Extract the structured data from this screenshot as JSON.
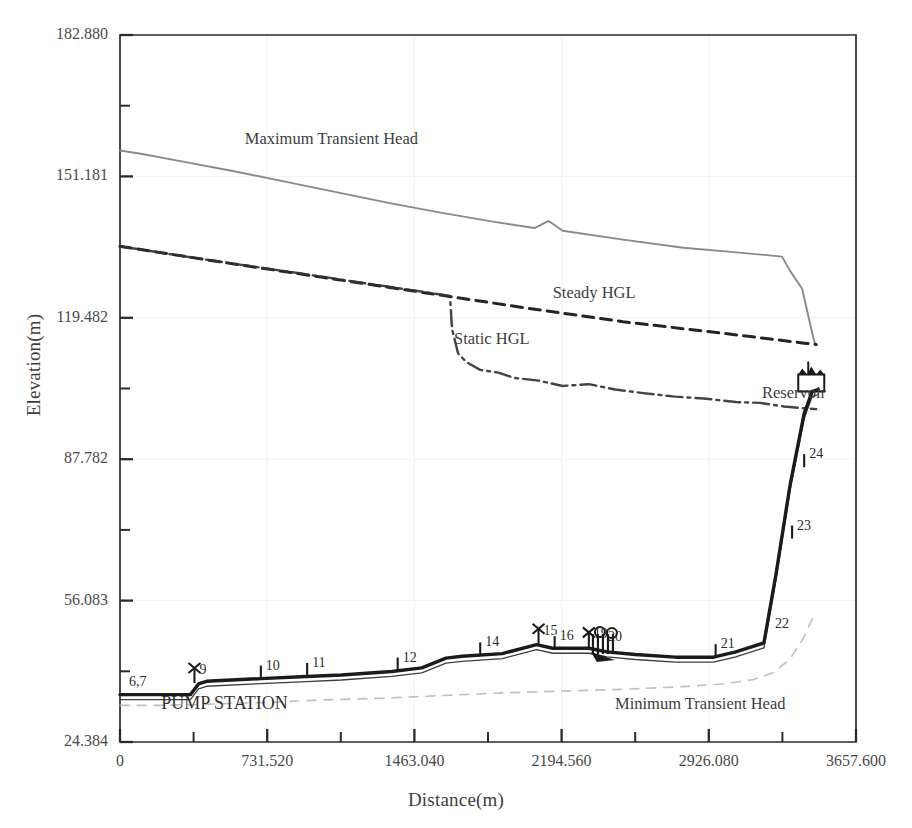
{
  "chart_data": {
    "type": "line",
    "title": "",
    "xlabel": "Distance(m)",
    "ylabel": "Elevation(m)",
    "xlim": [
      0,
      3657.6
    ],
    "ylim": [
      24.384,
      182.88
    ],
    "xticks": [
      "0",
      "731.520",
      "1463.040",
      "2194.560",
      "2926.080",
      "3657.600"
    ],
    "xtick_values": [
      0,
      731.52,
      1463.04,
      2194.56,
      2926.08,
      3657.6
    ],
    "yticks": [
      "182.880",
      "151.181",
      "119.482",
      "87.782",
      "56.083",
      "24.384"
    ],
    "ytick_values": [
      182.88,
      151.181,
      119.482,
      87.782,
      56.083,
      24.384
    ],
    "minor_ticks": true,
    "grid": "faint",
    "legend": "none (inline annotations)",
    "annotations": [
      {
        "name": "max-transient-head",
        "text": "Maximum Transient Head",
        "x": 620,
        "y": 158.5
      },
      {
        "name": "steady-hgl",
        "text": "Steady HGL",
        "x": 2150,
        "y": 124.0
      },
      {
        "name": "static-hgl",
        "text": "Static HGL",
        "x": 1660,
        "y": 113.5
      },
      {
        "name": "reservoir",
        "text": "Reservoir",
        "x": 3190,
        "y": 101.5
      },
      {
        "name": "minimum-transient-head",
        "text": "Minimum Transient Head",
        "x": 2460,
        "y": 31.8
      },
      {
        "name": "pump-station",
        "text": "PUMP STATION",
        "x": 205,
        "y": 31.8
      }
    ],
    "series": [
      {
        "name": "Maximum Transient Head",
        "style": "solid",
        "color": "#8a8a8a",
        "points": [
          [
            0,
            157.0
          ],
          [
            110,
            156.2
          ],
          [
            300,
            154.6
          ],
          [
            560,
            152.4
          ],
          [
            820,
            150.0
          ],
          [
            1080,
            147.6
          ],
          [
            1340,
            145.2
          ],
          [
            1600,
            143.0
          ],
          [
            1860,
            141.0
          ],
          [
            2060,
            139.6
          ],
          [
            2130,
            141.2
          ],
          [
            2200,
            139.0
          ],
          [
            2500,
            137.0
          ],
          [
            2800,
            135.2
          ],
          [
            3050,
            134.2
          ],
          [
            3200,
            133.6
          ],
          [
            3290,
            133.2
          ],
          [
            3330,
            130.0
          ],
          [
            3390,
            126.0
          ],
          [
            3420,
            120.0
          ],
          [
            3440,
            116.0
          ],
          [
            3455,
            113.5
          ]
        ]
      },
      {
        "name": "Steady HGL",
        "style": "dashed",
        "color": "#242424",
        "points": [
          [
            0,
            135.5
          ],
          [
            500,
            132.0
          ],
          [
            1000,
            128.6
          ],
          [
            1500,
            125.2
          ],
          [
            2000,
            121.8
          ],
          [
            2500,
            118.6
          ],
          [
            3000,
            116.0
          ],
          [
            3400,
            113.8
          ],
          [
            3460,
            113.5
          ]
        ]
      },
      {
        "name": "Static HGL",
        "style": "dashdot",
        "color": "#333333",
        "points": [
          [
            0,
            135.5
          ],
          [
            400,
            132.7
          ],
          [
            900,
            129.4
          ],
          [
            1400,
            126.0
          ],
          [
            1640,
            124.4
          ],
          [
            1650,
            117.0
          ],
          [
            1680,
            111.5
          ],
          [
            1720,
            109.6
          ],
          [
            1790,
            107.8
          ],
          [
            1880,
            107.2
          ],
          [
            1960,
            106.0
          ],
          [
            2080,
            105.4
          ],
          [
            2200,
            104.2
          ],
          [
            2330,
            104.6
          ],
          [
            2460,
            103.4
          ],
          [
            2600,
            102.6
          ],
          [
            2760,
            101.8
          ],
          [
            2900,
            101.4
          ],
          [
            3060,
            100.6
          ],
          [
            3180,
            100.4
          ],
          [
            3300,
            99.6
          ],
          [
            3400,
            99.2
          ],
          [
            3460,
            99.0
          ]
        ]
      },
      {
        "name": "Minimum Transient Head",
        "style": "dashed-light",
        "color": "#b5b5b5",
        "points": [
          [
            0,
            32.6
          ],
          [
            200,
            32.6
          ],
          [
            400,
            32.8
          ],
          [
            700,
            33.2
          ],
          [
            1000,
            33.8
          ],
          [
            1300,
            34.2
          ],
          [
            1600,
            34.8
          ],
          [
            1900,
            35.4
          ],
          [
            2200,
            35.8
          ],
          [
            2500,
            36.2
          ],
          [
            2800,
            36.8
          ],
          [
            3000,
            37.4
          ],
          [
            3150,
            38.4
          ],
          [
            3250,
            40.0
          ],
          [
            3330,
            43.0
          ],
          [
            3400,
            48.0
          ],
          [
            3440,
            52.0
          ]
        ]
      },
      {
        "name": "Pipeline Profile",
        "style": "solid-thick",
        "color": "#1b1b1b",
        "points": [
          [
            0,
            35.0
          ],
          [
            60,
            35.0
          ],
          [
            350,
            35.0
          ],
          [
            390,
            37.4
          ],
          [
            430,
            38.0
          ],
          [
            700,
            38.6
          ],
          [
            900,
            39.0
          ],
          [
            1100,
            39.4
          ],
          [
            1350,
            40.2
          ],
          [
            1500,
            41.0
          ],
          [
            1620,
            43.2
          ],
          [
            1700,
            43.6
          ],
          [
            1900,
            44.2
          ],
          [
            2070,
            46.2
          ],
          [
            2150,
            45.4
          ],
          [
            2330,
            45.4
          ],
          [
            2420,
            44.6
          ],
          [
            2560,
            44.0
          ],
          [
            2760,
            43.4
          ],
          [
            2950,
            43.4
          ],
          [
            3060,
            44.6
          ],
          [
            3200,
            46.6
          ],
          [
            3260,
            62.0
          ],
          [
            3330,
            82.0
          ],
          [
            3400,
            98.0
          ],
          [
            3440,
            103.0
          ],
          [
            3470,
            103.4
          ]
        ]
      }
    ],
    "nodes": [
      {
        "label": "6,7",
        "x": 20,
        "y": 35.0
      },
      {
        "label": "9",
        "x": 370,
        "y": 37.6,
        "marker": "valve"
      },
      {
        "label": "10",
        "x": 700,
        "y": 38.6,
        "marker": "tick"
      },
      {
        "label": "11",
        "x": 930,
        "y": 39.2,
        "marker": "tick"
      },
      {
        "label": "12",
        "x": 1380,
        "y": 40.4,
        "marker": "tick"
      },
      {
        "label": "14",
        "x": 1790,
        "y": 43.8,
        "marker": "tick"
      },
      {
        "label": "15",
        "x": 2080,
        "y": 46.4,
        "marker": "valve"
      },
      {
        "label": "16",
        "x": 2160,
        "y": 45.2,
        "marker": "tick"
      },
      {
        "label": "19",
        "x": 2330,
        "y": 45.6,
        "marker": "valve"
      },
      {
        "label": "20",
        "x": 2400,
        "y": 45.0,
        "marker": "cluster"
      },
      {
        "label": "21",
        "x": 2960,
        "y": 43.4,
        "marker": "tick"
      },
      {
        "label": "22",
        "x": 3230,
        "y": 48.0
      },
      {
        "label": "23",
        "x": 3340,
        "y": 70.0,
        "marker": "tick"
      },
      {
        "label": "24",
        "x": 3400,
        "y": 86.0,
        "marker": "tick"
      },
      {
        "label": "",
        "x": 3470,
        "y": 103.4,
        "marker": "reservoir-box"
      }
    ]
  }
}
